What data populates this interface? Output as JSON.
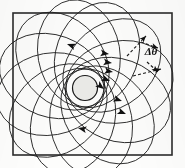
{
  "figure": {
    "kind": "precessing-orbit-diagram",
    "caption_label": "",
    "annotation": {
      "angle_symbol": "Δθ",
      "angle_name": "precession-angle"
    },
    "colors": {
      "background": "#fdfdfc",
      "panel_fill": "#fbfbfa",
      "frame_stroke": "#2b2b2b",
      "orbit_stroke": "#1f1f1f",
      "central_body_fill": "#e9e9e6",
      "central_body_stroke": "#1a1a1a",
      "arrow_fill": "#111111",
      "label_color": "#111111"
    }
  },
  "chart_data": {
    "type": "line",
    "title": "",
    "subtitle": "",
    "xlabel": "",
    "ylabel": "",
    "grid": false,
    "legend_position": "none",
    "frame": {
      "x": 13,
      "y": 13,
      "width": 159,
      "height": 142
    },
    "focus": {
      "x": 85,
      "y": 88
    },
    "central_body": {
      "cx": 85,
      "cy": 88,
      "r": 12.5
    },
    "ellipse_count": 12,
    "ellipse_semi_major": 54,
    "ellipse_semi_minor": 41,
    "focus_offset": 35,
    "precession_step_deg": 30,
    "start_angle_deg": -100,
    "annotations": [
      {
        "name": "precession-angle-label",
        "text": "Δθ",
        "x": 151,
        "y": 55
      }
    ],
    "direction_arrows": [
      {
        "name": "arrow-upper-left",
        "x": 67,
        "y": 44,
        "angle_deg": 200
      },
      {
        "name": "arrow-upper-right-1",
        "x": 109,
        "y": 54,
        "angle_deg": 8
      },
      {
        "name": "arrow-upper-right-2",
        "x": 112,
        "y": 63,
        "angle_deg": 8
      },
      {
        "name": "arrow-upper-right-3",
        "x": 113,
        "y": 72,
        "angle_deg": 10
      },
      {
        "name": "arrow-mid-right-1",
        "x": 110,
        "y": 81,
        "angle_deg": 22
      },
      {
        "name": "arrow-mid-right-2",
        "x": 104,
        "y": 89,
        "angle_deg": 38
      },
      {
        "name": "arrow-lower-right-1",
        "x": 122,
        "y": 101,
        "angle_deg": 18
      },
      {
        "name": "arrow-lower-right-2",
        "x": 126,
        "y": 114,
        "angle_deg": 22
      },
      {
        "name": "arrow-lower-left",
        "x": 78,
        "y": 128,
        "angle_deg": 192
      }
    ],
    "dashed_guides": [
      {
        "name": "precession-wedge-upper",
        "x1": 127,
        "y1": 56,
        "x2": 146,
        "y2": 36
      },
      {
        "name": "precession-wedge-lower",
        "x1": 133,
        "y1": 76,
        "x2": 161,
        "y2": 69
      },
      {
        "name": "precession-arc-upper",
        "x1": 141,
        "y1": 42,
        "x2": 158,
        "y2": 48
      },
      {
        "name": "precession-arc-lower",
        "x1": 147,
        "y1": 62,
        "x2": 158,
        "y2": 72
      }
    ]
  }
}
